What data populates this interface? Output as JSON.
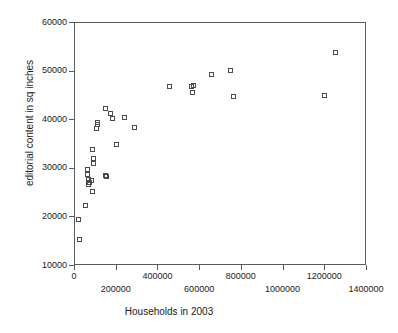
{
  "chart_data": {
    "type": "scatter",
    "title": "",
    "xlabel": "Households in 2003",
    "ylabel": "editorial content in sq inches",
    "xlim": [
      0,
      1400000
    ],
    "ylim": [
      10000,
      60000
    ],
    "grid": false,
    "legend": null,
    "marker": "open-square",
    "xticks": [
      0,
      200000,
      400000,
      600000,
      800000,
      1000000,
      1200000,
      1400000
    ],
    "xtick_labels": [
      "0",
      "200000",
      "400000",
      "600000",
      "800000",
      "1000000",
      "1200000",
      "1400000"
    ],
    "xtick_label_rows": [
      0,
      1,
      0,
      1,
      0,
      1,
      0,
      1
    ],
    "yticks": [
      10000,
      20000,
      30000,
      40000,
      50000,
      60000
    ],
    "ytick_labels": [
      "10000",
      "20000",
      "30000",
      "40000",
      "50000",
      "60000"
    ],
    "points": [
      {
        "x": 20000,
        "y": 15500
      },
      {
        "x": 18000,
        "y": 19500
      },
      {
        "x": 48000,
        "y": 22400
      },
      {
        "x": 60000,
        "y": 29900
      },
      {
        "x": 62000,
        "y": 28800
      },
      {
        "x": 66000,
        "y": 27800
      },
      {
        "x": 68000,
        "y": 27200
      },
      {
        "x": 64000,
        "y": 26800
      },
      {
        "x": 80000,
        "y": 27500
      },
      {
        "x": 86000,
        "y": 25400
      },
      {
        "x": 90000,
        "y": 31000
      },
      {
        "x": 88000,
        "y": 32100
      },
      {
        "x": 86000,
        "y": 34000
      },
      {
        "x": 105000,
        "y": 38300
      },
      {
        "x": 106000,
        "y": 39200
      },
      {
        "x": 108000,
        "y": 39500
      },
      {
        "x": 145000,
        "y": 28600
      },
      {
        "x": 150000,
        "y": 28500
      },
      {
        "x": 148000,
        "y": 42500
      },
      {
        "x": 168000,
        "y": 41300
      },
      {
        "x": 182000,
        "y": 40300
      },
      {
        "x": 200000,
        "y": 35100
      },
      {
        "x": 236000,
        "y": 40500
      },
      {
        "x": 285000,
        "y": 38600
      },
      {
        "x": 452000,
        "y": 46900
      },
      {
        "x": 560000,
        "y": 47000
      },
      {
        "x": 566000,
        "y": 47200
      },
      {
        "x": 562000,
        "y": 45700
      },
      {
        "x": 655000,
        "y": 49400
      },
      {
        "x": 745000,
        "y": 50200
      },
      {
        "x": 760000,
        "y": 44800
      },
      {
        "x": 1195000,
        "y": 45000
      },
      {
        "x": 1250000,
        "y": 54000
      }
    ]
  }
}
